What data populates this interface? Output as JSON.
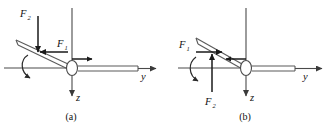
{
  "figure": {
    "background_color": "#ffffff",
    "axis_color": "#4a4a4a",
    "force_color": "#1a1a1a",
    "panels": [
      {
        "caption": "(a)",
        "axes": [
          {
            "name": "y",
            "label": "y",
            "direction": "right"
          },
          {
            "name": "z",
            "label": "z",
            "direction": "down"
          }
        ],
        "forces": [
          {
            "name": "F2",
            "label": "F",
            "subscript": "2",
            "direction": "down"
          },
          {
            "name": "F1",
            "label": "F",
            "subscript": "1",
            "direction": "left"
          }
        ],
        "hub_arrow_direction": "right",
        "spin_arrow_direction": "clockwise-front"
      },
      {
        "caption": "(b)",
        "axes": [
          {
            "name": "y",
            "label": "y",
            "direction": "right"
          },
          {
            "name": "z",
            "label": "z",
            "direction": "down"
          }
        ],
        "forces": [
          {
            "name": "F1",
            "label": "F",
            "subscript": "1",
            "direction": "right"
          },
          {
            "name": "F2",
            "label": "F",
            "subscript": "2",
            "direction": "up"
          }
        ],
        "hub_arrow_direction": "left",
        "spin_arrow_direction": "clockwise-front"
      }
    ]
  }
}
